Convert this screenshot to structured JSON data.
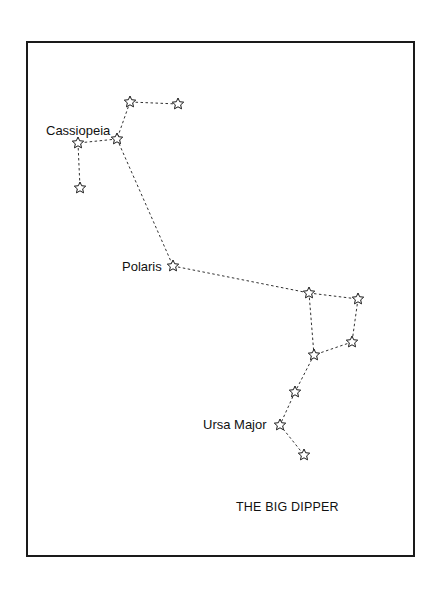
{
  "diagram": {
    "title": "THE BIG DIPPER",
    "labels": {
      "cassiopeia": "Cassiopeia",
      "polaris": "Polaris",
      "ursa_major": "Ursa Major"
    },
    "stars": [
      {
        "id": "cas1",
        "x": 130,
        "y": 102
      },
      {
        "id": "cas2",
        "x": 178,
        "y": 104
      },
      {
        "id": "cas3",
        "x": 117,
        "y": 139
      },
      {
        "id": "cas4",
        "x": 78,
        "y": 143
      },
      {
        "id": "cas5",
        "x": 80,
        "y": 188
      },
      {
        "id": "polaris",
        "x": 173,
        "y": 266
      },
      {
        "id": "um1",
        "x": 309,
        "y": 293
      },
      {
        "id": "um2",
        "x": 358,
        "y": 299
      },
      {
        "id": "um3",
        "x": 352,
        "y": 342
      },
      {
        "id": "um4",
        "x": 314,
        "y": 355
      },
      {
        "id": "um5",
        "x": 295,
        "y": 392
      },
      {
        "id": "um6",
        "x": 280,
        "y": 425
      },
      {
        "id": "um7",
        "x": 304,
        "y": 455
      }
    ],
    "connections": [
      [
        "cas2",
        "cas1"
      ],
      [
        "cas1",
        "cas3"
      ],
      [
        "cas3",
        "cas4"
      ],
      [
        "cas4",
        "cas5"
      ],
      [
        "cas3",
        "polaris"
      ],
      [
        "polaris",
        "um1"
      ],
      [
        "um1",
        "um2"
      ],
      [
        "um2",
        "um3"
      ],
      [
        "um3",
        "um4"
      ],
      [
        "um4",
        "um1"
      ],
      [
        "um4",
        "um5"
      ],
      [
        "um5",
        "um6"
      ],
      [
        "um6",
        "um7"
      ]
    ],
    "colors": {
      "ink": "#1a1a1a",
      "background": "#ffffff"
    }
  }
}
